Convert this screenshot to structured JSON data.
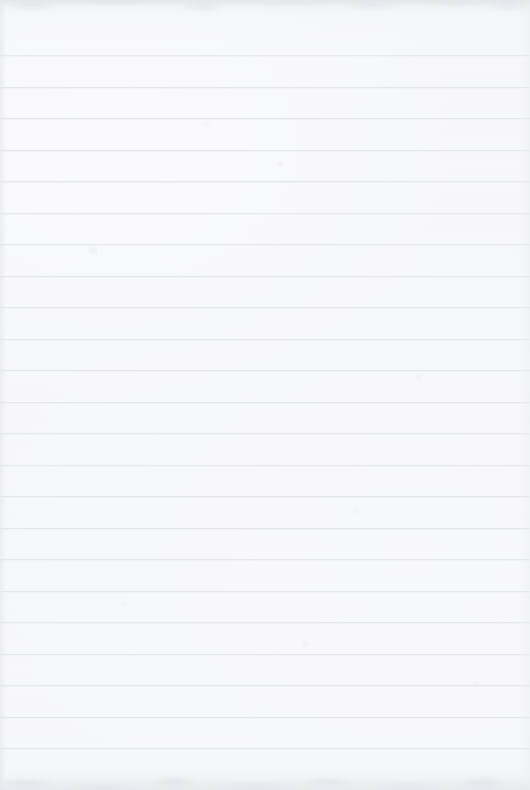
{
  "page": {
    "kind": "blank-ruled-notebook-paper",
    "width_px": 530,
    "height_px": 790,
    "orientation": "portrait",
    "written_content": "",
    "visible_text": "",
    "has_margin_rule": false,
    "has_punch_holes": false,
    "has_header": false,
    "has_page_number": false
  },
  "colors": {
    "paper_background": "#fcfcfd",
    "paper_shade": "#f7f8f9",
    "rule_line": "#e5e7ea",
    "rule_line_halo": "#f2f3f5",
    "edge_shadow": "#e2e4e8",
    "smudge": "#dee0e5"
  },
  "ruling": {
    "style": "horizontal-ruled",
    "line_count": 23,
    "first_line_y": 55,
    "line_spacing_px": 31.5,
    "line_thickness_px": 1,
    "line_inset_left_px": 0,
    "line_inset_right_px": 0,
    "line_y_positions": [
      55,
      86.5,
      118,
      149.5,
      181,
      212.5,
      244,
      275.5,
      307,
      338.5,
      370,
      401.5,
      433,
      464.5,
      496,
      527.5,
      559,
      590.5,
      622,
      653.5,
      685,
      716.5,
      748
    ]
  },
  "edges": {
    "top_shadow_height_px": 16,
    "bottom_shadow_height_px": 26,
    "left_shadow_width_px": 6,
    "right_shadow_width_px": 10
  },
  "smudges": [
    {
      "x": 88,
      "y": 243,
      "w": 10,
      "h": 14,
      "opacity": 0.55
    },
    {
      "x": 276,
      "y": 160,
      "w": 9,
      "h": 8,
      "opacity": 0.45
    },
    {
      "x": 415,
      "y": 372,
      "w": 8,
      "h": 9,
      "opacity": 0.4
    },
    {
      "x": 200,
      "y": 120,
      "w": 12,
      "h": 7,
      "opacity": 0.35
    },
    {
      "x": 352,
      "y": 505,
      "w": 9,
      "h": 10,
      "opacity": 0.42
    },
    {
      "x": 470,
      "y": 680,
      "w": 11,
      "h": 7,
      "opacity": 0.38
    },
    {
      "x": 120,
      "y": 600,
      "w": 8,
      "h": 9,
      "opacity": 0.34
    },
    {
      "x": 300,
      "y": 640,
      "w": 10,
      "h": 8,
      "opacity": 0.36
    }
  ]
}
